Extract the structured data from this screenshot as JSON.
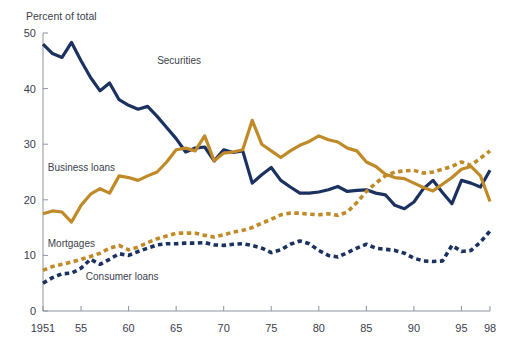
{
  "chart_data": {
    "type": "line",
    "title": "",
    "ylabel": "Percent of total",
    "xlabel": "",
    "ylim": [
      0,
      50
    ],
    "xlim": [
      1951,
      1998
    ],
    "yticks": [
      0,
      10,
      20,
      30,
      40,
      50
    ],
    "ytick_labels": [
      "0",
      "10",
      "20",
      "30",
      "40",
      "50"
    ],
    "xticks": [
      1951,
      1955,
      1960,
      1965,
      1970,
      1975,
      1980,
      1985,
      1990,
      1995,
      1998
    ],
    "xtick_labels": [
      "1951",
      "55",
      "60",
      "65",
      "70",
      "75",
      "80",
      "85",
      "90",
      "95",
      "98"
    ],
    "grid": false,
    "legend_position": "inline-annotations",
    "x": [
      1951,
      1952,
      1953,
      1954,
      1955,
      1956,
      1957,
      1958,
      1959,
      1960,
      1961,
      1962,
      1963,
      1964,
      1965,
      1966,
      1967,
      1968,
      1969,
      1970,
      1971,
      1972,
      1973,
      1974,
      1975,
      1976,
      1977,
      1978,
      1979,
      1980,
      1981,
      1982,
      1983,
      1984,
      1985,
      1986,
      1987,
      1988,
      1989,
      1990,
      1991,
      1992,
      1993,
      1994,
      1995,
      1996,
      1997,
      1998
    ],
    "series": [
      {
        "name": "Securities",
        "color": "#1b3160",
        "style": "solid",
        "label_x": 1963,
        "label_y": 44.5,
        "values": [
          48.0,
          46.3,
          45.6,
          48.3,
          45.0,
          42.0,
          39.6,
          41.0,
          38.0,
          37.0,
          36.3,
          36.8,
          35.0,
          33.0,
          31.0,
          28.6,
          29.3,
          29.5,
          27.0,
          29.0,
          28.5,
          28.8,
          23.0,
          24.5,
          25.8,
          23.5,
          22.3,
          21.2,
          21.2,
          21.4,
          21.8,
          22.4,
          21.5,
          21.7,
          21.8,
          21.2,
          20.9,
          19.0,
          18.4,
          19.6,
          22.0,
          23.5,
          21.3,
          19.3,
          23.5,
          23.0,
          22.3,
          25.3
        ]
      },
      {
        "name": "Business loans",
        "color": "#c08a28",
        "style": "solid",
        "label_x": 1951.5,
        "label_y": 25.2,
        "values": [
          17.5,
          18.0,
          17.8,
          16.0,
          19.0,
          21.0,
          22.0,
          21.2,
          24.3,
          24.0,
          23.5,
          24.3,
          25.0,
          26.8,
          29.0,
          29.3,
          28.8,
          31.5,
          27.0,
          28.4,
          28.6,
          29.0,
          34.3,
          30.0,
          28.8,
          27.6,
          28.8,
          29.8,
          30.5,
          31.5,
          30.8,
          30.4,
          29.3,
          28.8,
          26.8,
          26.0,
          24.6,
          24.0,
          23.8,
          23.0,
          22.2,
          21.6,
          22.8,
          24.0,
          25.5,
          26.0,
          24.3,
          19.7
        ]
      },
      {
        "name": "Mortgages",
        "color": "#c08a28",
        "style": "dotted",
        "label_x": 1951.5,
        "label_y": 11.6,
        "values": [
          7.3,
          8.0,
          8.4,
          8.8,
          9.3,
          9.8,
          10.4,
          11.3,
          11.8,
          11.0,
          11.5,
          12.3,
          13.0,
          13.5,
          14.0,
          14.0,
          14.0,
          13.6,
          13.3,
          13.7,
          14.2,
          14.5,
          15.0,
          15.8,
          16.5,
          17.3,
          17.6,
          17.6,
          17.4,
          17.3,
          17.5,
          17.2,
          17.8,
          19.5,
          21.5,
          23.0,
          24.3,
          25.0,
          25.2,
          25.3,
          24.8,
          25.0,
          25.5,
          26.0,
          26.8,
          26.2,
          27.5,
          28.8
        ]
      },
      {
        "name": "Consumer loans",
        "color": "#1b3160",
        "style": "dotted",
        "label_x": 1955.5,
        "label_y": 5.6,
        "values": [
          5.0,
          6.0,
          6.7,
          6.8,
          7.7,
          9.3,
          8.4,
          9.3,
          10.3,
          10.0,
          10.7,
          11.3,
          11.9,
          12.1,
          12.1,
          12.2,
          12.2,
          12.3,
          11.9,
          11.8,
          12.0,
          12.1,
          11.8,
          11.3,
          10.5,
          11.0,
          12.0,
          12.6,
          12.1,
          10.9,
          10.0,
          9.7,
          10.5,
          11.3,
          12.0,
          11.3,
          11.1,
          10.9,
          10.4,
          9.5,
          9.0,
          8.9,
          9.0,
          11.8,
          10.7,
          10.9,
          12.4,
          14.4
        ]
      }
    ]
  },
  "annotations": {
    "securities": "Securities",
    "business_loans": "Business loans",
    "mortgages": "Mortgages",
    "consumer_loans": "Consumer loans"
  },
  "colors": {
    "navy": "#1b3160",
    "gold": "#c08a28",
    "axis": "#8d93a0",
    "text": "#3b414d",
    "background": "#ffffff"
  }
}
